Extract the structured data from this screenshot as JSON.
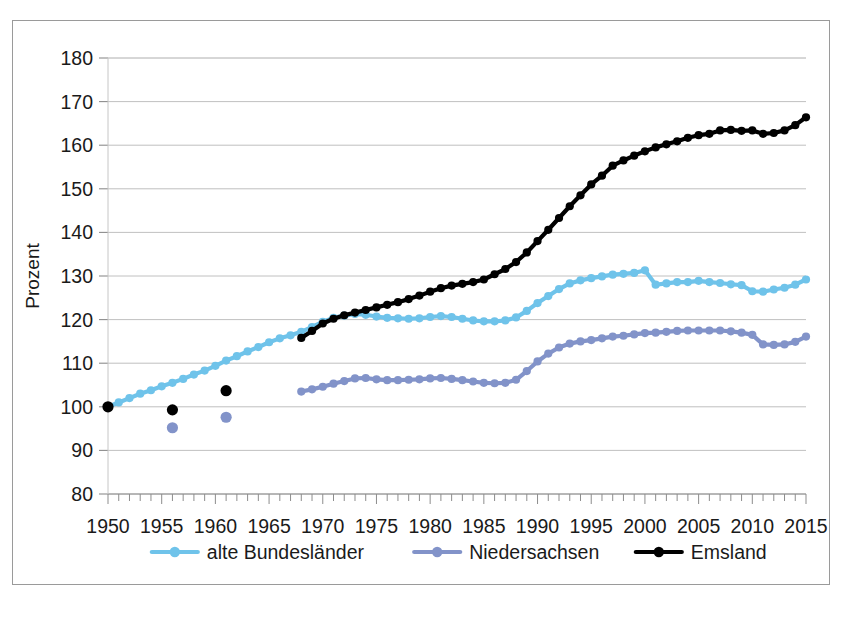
{
  "figure": {
    "border_color": "#9a9a9a",
    "background": "#ffffff"
  },
  "axis": {
    "ylabel": "Prozent",
    "y_ticks": [
      "80",
      "90",
      "100",
      "110",
      "120",
      "130",
      "140",
      "150",
      "160",
      "170",
      "180"
    ],
    "x_ticks": [
      "1950",
      "1955",
      "1960",
      "1965",
      "1970",
      "1975",
      "1980",
      "1985",
      "1990",
      "1995",
      "2000",
      "2005",
      "2010",
      "2015"
    ]
  },
  "legend": {
    "items": [
      {
        "label": "alte Bundesländer",
        "color": "#6FC3EA"
      },
      {
        "label": "Niedersachsen",
        "color": "#8293C9"
      },
      {
        "label": "Emsland",
        "color": "#000000"
      }
    ]
  },
  "chart_data": {
    "type": "line",
    "title": "",
    "xlabel": "",
    "ylabel": "Prozent",
    "xlim": [
      1950,
      2015
    ],
    "ylim": [
      80,
      180
    ],
    "ytick_step": 10,
    "xtick_step": 5,
    "x_minor_tick_step": 1,
    "grid": true,
    "legend_position": "bottom",
    "series": [
      {
        "name": "alte Bundesländer",
        "color": "#6FC3EA",
        "marker": "circle",
        "points": [
          {
            "x": 1950,
            "y": 100.0
          },
          {
            "x": 1951,
            "y": 101.0
          },
          {
            "x": 1952,
            "y": 102.0
          },
          {
            "x": 1953,
            "y": 103.0
          },
          {
            "x": 1954,
            "y": 103.8
          },
          {
            "x": 1955,
            "y": 104.7
          },
          {
            "x": 1956,
            "y": 105.5
          },
          {
            "x": 1957,
            "y": 106.4
          },
          {
            "x": 1958,
            "y": 107.4
          },
          {
            "x": 1959,
            "y": 108.3
          },
          {
            "x": 1960,
            "y": 109.4
          },
          {
            "x": 1961,
            "y": 110.6
          },
          {
            "x": 1962,
            "y": 111.6
          },
          {
            "x": 1963,
            "y": 112.7
          },
          {
            "x": 1964,
            "y": 113.7
          },
          {
            "x": 1965,
            "y": 114.8
          },
          {
            "x": 1966,
            "y": 115.7
          },
          {
            "x": 1967,
            "y": 116.4
          },
          {
            "x": 1968,
            "y": 117.2
          },
          {
            "x": 1969,
            "y": 118.3
          },
          {
            "x": 1970,
            "y": 119.5
          },
          {
            "x": 1971,
            "y": 120.4
          },
          {
            "x": 1972,
            "y": 120.9
          },
          {
            "x": 1973,
            "y": 121.3
          },
          {
            "x": 1974,
            "y": 121.1
          },
          {
            "x": 1975,
            "y": 120.7
          },
          {
            "x": 1976,
            "y": 120.4
          },
          {
            "x": 1977,
            "y": 120.3
          },
          {
            "x": 1978,
            "y": 120.2
          },
          {
            "x": 1979,
            "y": 120.3
          },
          {
            "x": 1980,
            "y": 120.6
          },
          {
            "x": 1981,
            "y": 120.8
          },
          {
            "x": 1982,
            "y": 120.6
          },
          {
            "x": 1983,
            "y": 120.2
          },
          {
            "x": 1984,
            "y": 119.8
          },
          {
            "x": 1985,
            "y": 119.6
          },
          {
            "x": 1986,
            "y": 119.6
          },
          {
            "x": 1987,
            "y": 119.8
          },
          {
            "x": 1988,
            "y": 120.5
          },
          {
            "x": 1989,
            "y": 122.0
          },
          {
            "x": 1990,
            "y": 123.8
          },
          {
            "x": 1991,
            "y": 125.4
          },
          {
            "x": 1992,
            "y": 127.0
          },
          {
            "x": 1993,
            "y": 128.3
          },
          {
            "x": 1994,
            "y": 129.0
          },
          {
            "x": 1995,
            "y": 129.5
          },
          {
            "x": 1996,
            "y": 129.9
          },
          {
            "x": 1997,
            "y": 130.3
          },
          {
            "x": 1998,
            "y": 130.5
          },
          {
            "x": 1999,
            "y": 130.7
          },
          {
            "x": 2000,
            "y": 131.3
          },
          {
            "x": 2001,
            "y": 128.0
          },
          {
            "x": 2002,
            "y": 128.3
          },
          {
            "x": 2003,
            "y": 128.6
          },
          {
            "x": 2004,
            "y": 128.6
          },
          {
            "x": 2005,
            "y": 128.9
          },
          {
            "x": 2006,
            "y": 128.6
          },
          {
            "x": 2007,
            "y": 128.4
          },
          {
            "x": 2008,
            "y": 128.1
          },
          {
            "x": 2009,
            "y": 127.9
          },
          {
            "x": 2010,
            "y": 126.5
          },
          {
            "x": 2011,
            "y": 126.4
          },
          {
            "x": 2012,
            "y": 126.9
          },
          {
            "x": 2013,
            "y": 127.3
          },
          {
            "x": 2014,
            "y": 128.0
          },
          {
            "x": 2015,
            "y": 129.2
          }
        ]
      },
      {
        "name": "Niedersachsen",
        "color": "#8293C9",
        "marker": "circle",
        "isolated_points": [
          {
            "x": 1956,
            "y": 95.2
          },
          {
            "x": 1961,
            "y": 97.6
          }
        ],
        "points": [
          {
            "x": 1968,
            "y": 103.5
          },
          {
            "x": 1969,
            "y": 104.0
          },
          {
            "x": 1970,
            "y": 104.6
          },
          {
            "x": 1971,
            "y": 105.3
          },
          {
            "x": 1972,
            "y": 105.9
          },
          {
            "x": 1973,
            "y": 106.5
          },
          {
            "x": 1974,
            "y": 106.6
          },
          {
            "x": 1975,
            "y": 106.3
          },
          {
            "x": 1976,
            "y": 106.1
          },
          {
            "x": 1977,
            "y": 106.1
          },
          {
            "x": 1978,
            "y": 106.2
          },
          {
            "x": 1979,
            "y": 106.3
          },
          {
            "x": 1980,
            "y": 106.5
          },
          {
            "x": 1981,
            "y": 106.6
          },
          {
            "x": 1982,
            "y": 106.4
          },
          {
            "x": 1983,
            "y": 106.1
          },
          {
            "x": 1984,
            "y": 105.8
          },
          {
            "x": 1985,
            "y": 105.5
          },
          {
            "x": 1986,
            "y": 105.4
          },
          {
            "x": 1987,
            "y": 105.5
          },
          {
            "x": 1988,
            "y": 106.2
          },
          {
            "x": 1989,
            "y": 108.2
          },
          {
            "x": 1990,
            "y": 110.4
          },
          {
            "x": 1991,
            "y": 112.2
          },
          {
            "x": 1992,
            "y": 113.6
          },
          {
            "x": 1993,
            "y": 114.5
          },
          {
            "x": 1994,
            "y": 115.0
          },
          {
            "x": 1995,
            "y": 115.3
          },
          {
            "x": 1996,
            "y": 115.7
          },
          {
            "x": 1997,
            "y": 116.1
          },
          {
            "x": 1998,
            "y": 116.3
          },
          {
            "x": 1999,
            "y": 116.6
          },
          {
            "x": 2000,
            "y": 116.9
          },
          {
            "x": 2001,
            "y": 117.0
          },
          {
            "x": 2002,
            "y": 117.2
          },
          {
            "x": 2003,
            "y": 117.4
          },
          {
            "x": 2004,
            "y": 117.5
          },
          {
            "x": 2005,
            "y": 117.5
          },
          {
            "x": 2006,
            "y": 117.5
          },
          {
            "x": 2007,
            "y": 117.5
          },
          {
            "x": 2008,
            "y": 117.3
          },
          {
            "x": 2009,
            "y": 117.0
          },
          {
            "x": 2010,
            "y": 116.5
          },
          {
            "x": 2011,
            "y": 114.3
          },
          {
            "x": 2012,
            "y": 114.2
          },
          {
            "x": 2013,
            "y": 114.3
          },
          {
            "x": 2014,
            "y": 114.9
          },
          {
            "x": 2015,
            "y": 116.1
          }
        ]
      },
      {
        "name": "Emsland",
        "color": "#000000",
        "marker": "circle",
        "isolated_points": [
          {
            "x": 1950,
            "y": 100.0
          },
          {
            "x": 1956,
            "y": 99.3
          },
          {
            "x": 1961,
            "y": 103.7
          }
        ],
        "points": [
          {
            "x": 1968,
            "y": 115.8
          },
          {
            "x": 1969,
            "y": 117.4
          },
          {
            "x": 1970,
            "y": 119.1
          },
          {
            "x": 1971,
            "y": 120.2
          },
          {
            "x": 1972,
            "y": 121.0
          },
          {
            "x": 1973,
            "y": 121.6
          },
          {
            "x": 1974,
            "y": 122.2
          },
          {
            "x": 1975,
            "y": 122.8
          },
          {
            "x": 1976,
            "y": 123.4
          },
          {
            "x": 1977,
            "y": 124.0
          },
          {
            "x": 1978,
            "y": 124.7
          },
          {
            "x": 1979,
            "y": 125.5
          },
          {
            "x": 1980,
            "y": 126.4
          },
          {
            "x": 1981,
            "y": 127.2
          },
          {
            "x": 1982,
            "y": 127.8
          },
          {
            "x": 1983,
            "y": 128.2
          },
          {
            "x": 1984,
            "y": 128.6
          },
          {
            "x": 1985,
            "y": 129.2
          },
          {
            "x": 1986,
            "y": 130.4
          },
          {
            "x": 1987,
            "y": 131.6
          },
          {
            "x": 1988,
            "y": 133.2
          },
          {
            "x": 1989,
            "y": 135.4
          },
          {
            "x": 1990,
            "y": 138.0
          },
          {
            "x": 1991,
            "y": 140.6
          },
          {
            "x": 1992,
            "y": 143.3
          },
          {
            "x": 1993,
            "y": 146.0
          },
          {
            "x": 1994,
            "y": 148.5
          },
          {
            "x": 1995,
            "y": 151.0
          },
          {
            "x": 1996,
            "y": 153.0
          },
          {
            "x": 1997,
            "y": 155.3
          },
          {
            "x": 1998,
            "y": 156.5
          },
          {
            "x": 1999,
            "y": 157.6
          },
          {
            "x": 2000,
            "y": 158.6
          },
          {
            "x": 2001,
            "y": 159.5
          },
          {
            "x": 2002,
            "y": 160.2
          },
          {
            "x": 2003,
            "y": 160.9
          },
          {
            "x": 2004,
            "y": 161.7
          },
          {
            "x": 2005,
            "y": 162.3
          },
          {
            "x": 2006,
            "y": 162.6
          },
          {
            "x": 2007,
            "y": 163.4
          },
          {
            "x": 2008,
            "y": 163.5
          },
          {
            "x": 2009,
            "y": 163.3
          },
          {
            "x": 2010,
            "y": 163.4
          },
          {
            "x": 2011,
            "y": 162.6
          },
          {
            "x": 2012,
            "y": 162.8
          },
          {
            "x": 2013,
            "y": 163.4
          },
          {
            "x": 2014,
            "y": 164.6
          },
          {
            "x": 2015,
            "y": 166.4
          }
        ]
      }
    ]
  }
}
